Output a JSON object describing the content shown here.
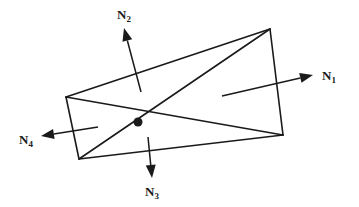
{
  "diagram": {
    "colors": {
      "stroke": "#1a1a1a",
      "background": "#ffffff"
    },
    "vertices": {
      "top_left": [
        66,
        97
      ],
      "top_right": [
        270,
        29
      ],
      "bottom_right": [
        283,
        135
      ],
      "bottom_left": [
        79,
        159
      ]
    },
    "center_node": [
      138,
      122
    ],
    "normals": [
      {
        "id": "N1",
        "letter": "N",
        "sub": "1",
        "from": [
          222,
          96
        ],
        "to": [
          313,
          75
        ],
        "label_pos": [
          322,
          80
        ]
      },
      {
        "id": "N2",
        "letter": "N",
        "sub": "2",
        "from": [
          141,
          92
        ],
        "to": [
          124,
          28
        ],
        "label_pos": [
          117,
          19
        ]
      },
      {
        "id": "N3",
        "letter": "N",
        "sub": "3",
        "from": [
          148,
          137
        ],
        "to": [
          152,
          178
        ],
        "label_pos": [
          145,
          196
        ]
      },
      {
        "id": "N4",
        "letter": "N",
        "sub": "4",
        "from": [
          98,
          127
        ],
        "to": [
          41,
          136
        ],
        "label_pos": [
          19,
          144
        ]
      }
    ]
  }
}
